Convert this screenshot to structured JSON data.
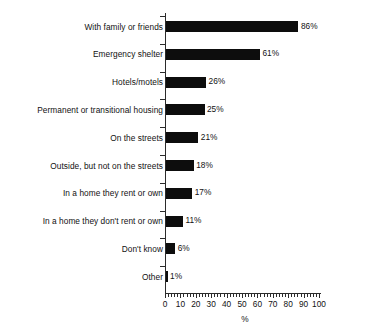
{
  "chart_data": {
    "type": "bar",
    "orientation": "horizontal",
    "title": "",
    "subtitle": "",
    "xlabel": "%",
    "ylabel": "",
    "xlim": [
      0,
      100
    ],
    "grid": false,
    "legend": null,
    "x_major_ticks": [
      0,
      10,
      20,
      30,
      40,
      50,
      60,
      70,
      80,
      90,
      100
    ],
    "x_minor_tick_step": 2,
    "x_tick_labels": [
      "0",
      "10",
      "20",
      "30",
      "40",
      "50",
      "60",
      "70",
      "80",
      "90",
      "100"
    ],
    "value_suffix": "%",
    "bar_color": "#0d0d0d",
    "categories": [
      "With family or friends",
      "Emergency shelter",
      "Hotels/motels",
      "Permanent or transitional housing",
      "On the streets",
      "Outside, but not on the streets",
      "In a home they rent or own",
      "In a home they don't rent or own",
      "Don't know",
      "Other"
    ],
    "values": [
      86,
      61,
      26,
      25,
      21,
      18,
      17,
      11,
      6,
      1
    ],
    "value_labels": [
      "86%",
      "61%",
      "26%",
      "25%",
      "21%",
      "18%",
      "17%",
      "11%",
      "6%",
      "1%"
    ]
  }
}
